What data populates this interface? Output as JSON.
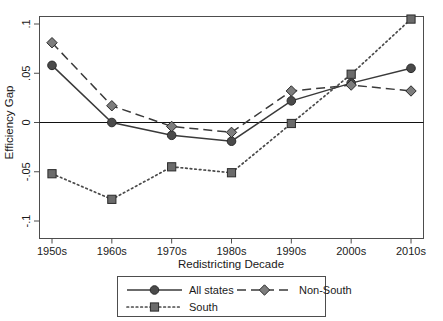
{
  "chart_data": {
    "type": "line",
    "title": "",
    "xlabel": "Redistricting Decade",
    "ylabel": "Efficiency Gap",
    "categories": [
      "1950s",
      "1960s",
      "1970s",
      "1980s",
      "1990s",
      "2000s",
      "2010s"
    ],
    "ylim": [
      -0.1,
      0.1
    ],
    "ytick_labels": [
      ".1",
      ".05",
      "0",
      "-.05",
      "-.1"
    ],
    "ytick_values": [
      0.1,
      0.05,
      0,
      -0.05,
      -0.1
    ],
    "grid": false,
    "legend_position": "below-axis",
    "zero_reference_line": 0,
    "series": [
      {
        "name": "All states",
        "values": [
          0.058,
          0.0,
          -0.013,
          -0.019,
          0.022,
          0.04,
          0.055
        ],
        "line_style": "solid",
        "marker": "circle",
        "color": "#3a3a3a",
        "marker_color": "#4a4a4a"
      },
      {
        "name": "Non-South",
        "values": [
          0.081,
          0.017,
          -0.004,
          -0.01,
          0.032,
          0.038,
          0.032
        ],
        "line_style": "dashed",
        "marker": "diamond",
        "color": "#3a3a3a",
        "marker_color": "#7d7d7d"
      },
      {
        "name": "South",
        "values": [
          -0.052,
          -0.078,
          -0.045,
          -0.051,
          -0.001,
          0.049,
          0.105
        ],
        "line_style": "dotted",
        "marker": "square",
        "color": "#4a4a4a",
        "marker_color": "#6b6b6b"
      }
    ]
  },
  "legend": {
    "entries": [
      {
        "label": "All states"
      },
      {
        "label": "Non-South"
      },
      {
        "label": "South"
      }
    ]
  },
  "colors": {
    "frame": "#4d4d4d",
    "zero_line": "#111111",
    "text": "#1a1a1a",
    "background": "#ffffff"
  }
}
